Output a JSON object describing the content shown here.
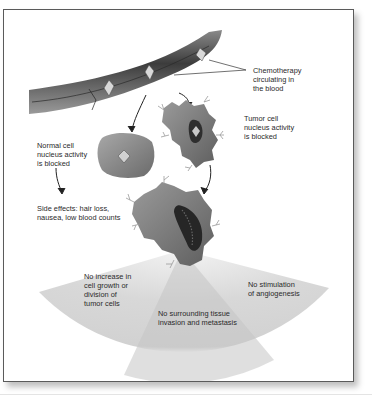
{
  "diagram": {
    "type": "medical-illustration",
    "labels": {
      "chemo_in_blood": "Chemotherapy\ncirculating in\nthe blood",
      "tumor_cell": "Tumor cell\nnucleus activity\nis blocked",
      "normal_cell": "Normal cell\nnucleus activity\nis blocked",
      "side_effects": "Side effects: hair loss,\nnausea, low blood counts",
      "no_growth": "No increase in\ncell growth or\ndivision of\ntumor cells",
      "no_invasion": "No surrounding tissue\ninvasion and metastasis",
      "no_angiogenesis": "No stimulation\nof angiogenesis"
    },
    "elements": [
      "blood-vessel",
      "chemotherapy-drug-particle",
      "normal-cell",
      "tumor-cell-small",
      "tumor-cell-large",
      "effect-fan"
    ],
    "colors": {
      "frame_border": "#5a5a5a",
      "cell_gray": "#7a7a7a",
      "vessel_dark": "#3a3a3a",
      "fan_gray": "#d0d0d0",
      "text": "#2a2a2a"
    }
  }
}
